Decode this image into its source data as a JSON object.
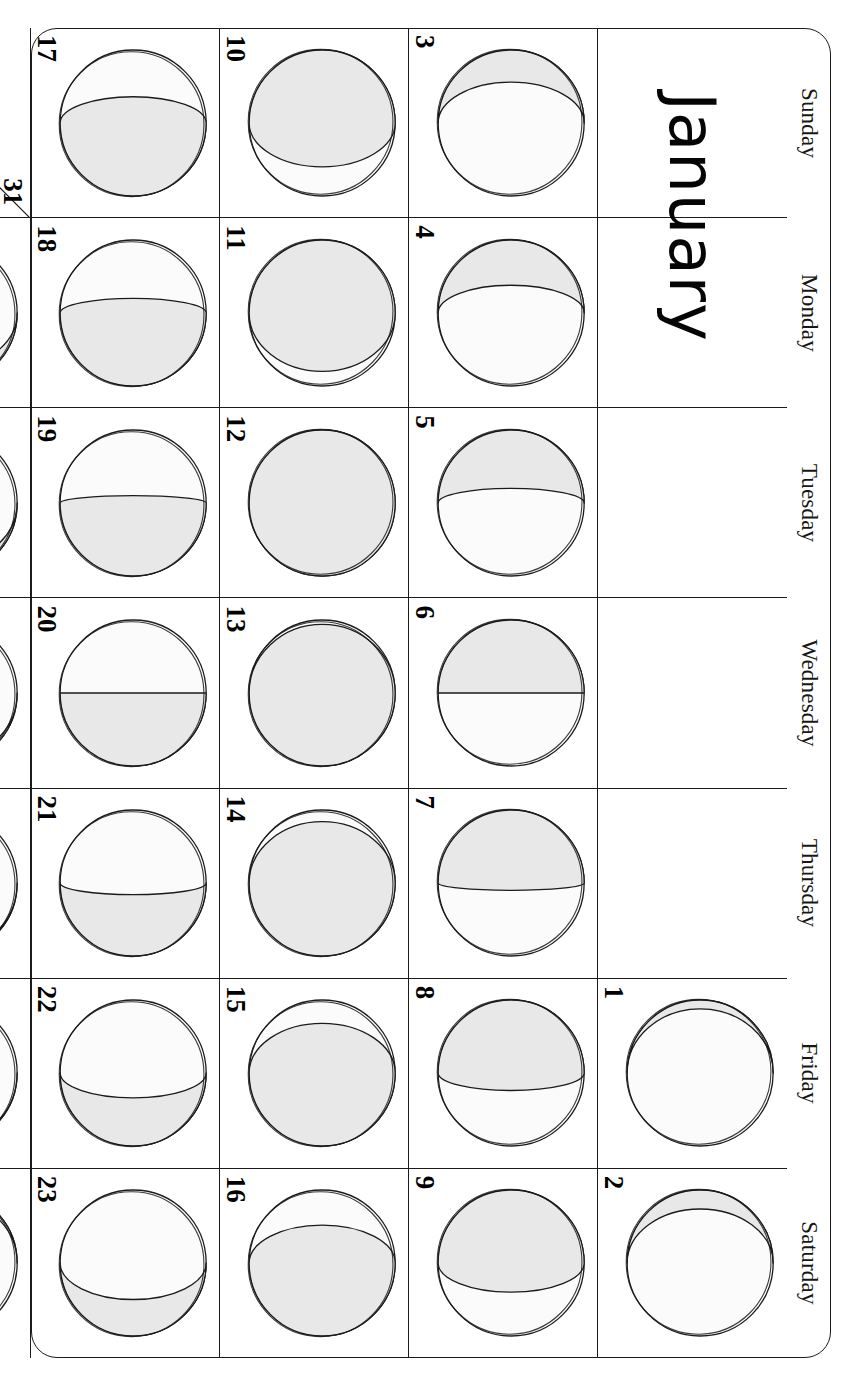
{
  "calendar": {
    "month_title": "January",
    "orientation": "rotated-90-clockwise",
    "day_names": [
      "Sunday",
      "Monday",
      "Tuesday",
      "Wednesday",
      "Thursday",
      "Friday",
      "Saturday"
    ],
    "colors": {
      "line": "#1b1b1b",
      "text": "#000000",
      "moon_shadow_fill": "#e8e8e8",
      "moon_lit_fill": "#fbfbfb",
      "page_background": "#ffffff"
    },
    "weeks": [
      [
        {
          "day": "",
          "phase": null
        },
        {
          "day": "",
          "phase": null
        },
        {
          "day": "",
          "phase": null
        },
        {
          "day": "",
          "phase": null
        },
        {
          "day": "",
          "phase": null
        },
        {
          "day": "1",
          "phase": {
            "name": "waxing-crescent",
            "illumination": 6,
            "waxing": true
          }
        },
        {
          "day": "2",
          "phase": {
            "name": "waxing-crescent",
            "illumination": 13,
            "waxing": true
          }
        }
      ],
      [
        {
          "day": "3",
          "phase": {
            "name": "waxing-crescent",
            "illumination": 22,
            "waxing": true
          }
        },
        {
          "day": "4",
          "phase": {
            "name": "waxing-crescent",
            "illumination": 31,
            "waxing": true
          }
        },
        {
          "day": "5",
          "phase": {
            "name": "waxing-crescent",
            "illumination": 40,
            "waxing": true
          }
        },
        {
          "day": "6",
          "phase": {
            "name": "first-quarter",
            "illumination": 50,
            "waxing": true
          }
        },
        {
          "day": "7",
          "phase": {
            "name": "waxing-gibbous",
            "illumination": 55,
            "waxing": true
          }
        },
        {
          "day": "8",
          "phase": {
            "name": "waxing-gibbous",
            "illumination": 62,
            "waxing": true
          }
        },
        {
          "day": "9",
          "phase": {
            "name": "waxing-gibbous",
            "illumination": 70,
            "waxing": true
          }
        }
      ],
      [
        {
          "day": "10",
          "phase": {
            "name": "waxing-gibbous",
            "illumination": 80,
            "waxing": true
          }
        },
        {
          "day": "11",
          "phase": {
            "name": "waxing-gibbous",
            "illumination": 90,
            "waxing": true
          }
        },
        {
          "day": "12",
          "phase": {
            "name": "full-moon",
            "illumination": 100,
            "waxing": true
          }
        },
        {
          "day": "13",
          "phase": {
            "name": "waning-gibbous",
            "illumination": 97,
            "waxing": false
          }
        },
        {
          "day": "14",
          "phase": {
            "name": "waning-gibbous",
            "illumination": 92,
            "waxing": false
          }
        },
        {
          "day": "15",
          "phase": {
            "name": "waning-gibbous",
            "illumination": 84,
            "waxing": false
          }
        },
        {
          "day": "16",
          "phase": {
            "name": "waning-gibbous",
            "illumination": 76,
            "waxing": false
          }
        }
      ],
      [
        {
          "day": "17",
          "phase": {
            "name": "waning-gibbous",
            "illumination": 68,
            "waxing": false
          }
        },
        {
          "day": "18",
          "phase": {
            "name": "waning-gibbous",
            "illumination": 60,
            "waxing": false
          }
        },
        {
          "day": "19",
          "phase": {
            "name": "waning-gibbous",
            "illumination": 55,
            "waxing": false
          }
        },
        {
          "day": "20",
          "phase": {
            "name": "last-quarter",
            "illumination": 50,
            "waxing": false
          }
        },
        {
          "day": "21",
          "phase": {
            "name": "waning-crescent",
            "illumination": 42,
            "waxing": false
          }
        },
        {
          "day": "22",
          "phase": {
            "name": "waning-crescent",
            "illumination": 33,
            "waxing": false
          }
        },
        {
          "day": "23",
          "phase": {
            "name": "waning-crescent",
            "illumination": 25,
            "waxing": false
          }
        }
      ],
      [
        {
          "day": "24",
          "phase": {
            "name": "waning-crescent",
            "illumination": 17,
            "waxing": false
          },
          "split_with": "31"
        },
        {
          "day": "25",
          "phase": {
            "name": "waning-crescent",
            "illumination": 12,
            "waxing": false
          }
        },
        {
          "day": "26",
          "phase": {
            "name": "waning-crescent",
            "illumination": 8,
            "waxing": false
          }
        },
        {
          "day": "27",
          "phase": {
            "name": "waning-crescent",
            "illumination": 4,
            "waxing": false
          }
        },
        {
          "day": "28",
          "phase": {
            "name": "waning-crescent",
            "illumination": 2,
            "waxing": false
          }
        },
        {
          "day": "29",
          "phase": {
            "name": "new-moon",
            "illumination": 1,
            "waxing": false
          }
        },
        {
          "day": "30",
          "phase": {
            "name": "waxing-crescent",
            "illumination": 5,
            "waxing": true
          }
        }
      ]
    ],
    "split_cell": {
      "first_day": "24",
      "second_day": "31",
      "second_phase": {
        "name": "waxing-crescent",
        "illumination": 11,
        "waxing": true
      }
    }
  }
}
